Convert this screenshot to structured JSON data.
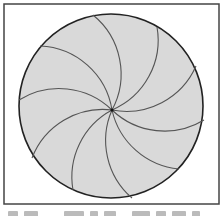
{
  "figure": {
    "frame": {
      "x": 4,
      "y": 4,
      "width": 215,
      "height": 200,
      "stroke": "#444444",
      "stroke_width": 1.5
    },
    "disk": {
      "cx": 111,
      "cy": 106,
      "r": 92,
      "fill": "#d9d9d9",
      "stroke": "#222222",
      "stroke_width": 1.6
    },
    "center_point": {
      "x": 112,
      "y": 110,
      "r": 1.6,
      "fill": "#111111"
    },
    "spiral_arms": {
      "count": 10,
      "arc_radius": 76,
      "stroke": "#555555",
      "stroke_width": 1.1,
      "endpoints": [
        [
          93,
          15
        ],
        [
          157,
          27
        ],
        [
          196,
          66
        ],
        [
          204,
          120
        ],
        [
          179,
          169
        ],
        [
          132,
          198
        ],
        [
          73,
          190
        ],
        [
          32,
          158
        ],
        [
          19,
          100
        ],
        [
          40,
          46
        ]
      ]
    }
  },
  "caption": {
    "text": "",
    "note": "caption line cut off at bottom edge"
  }
}
